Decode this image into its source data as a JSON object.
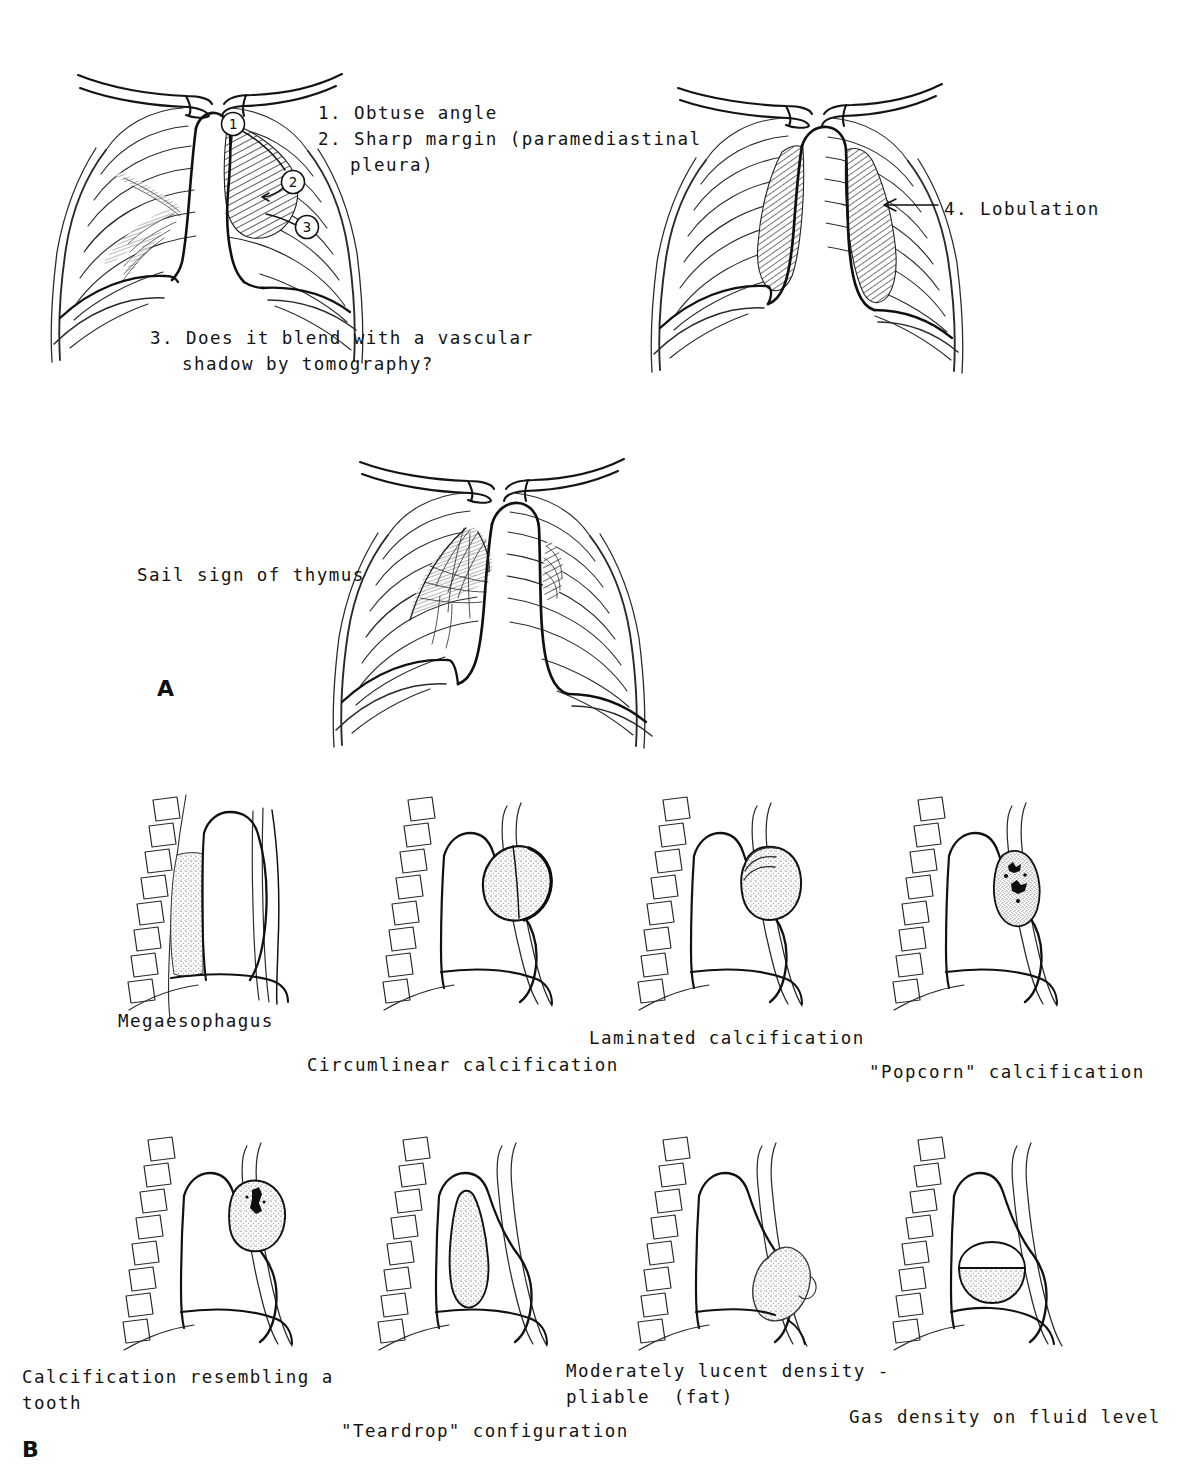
{
  "figure": {
    "panels": [
      {
        "id": "A",
        "letter": "A"
      },
      {
        "id": "B",
        "letter": "B"
      }
    ]
  },
  "panel_a": {
    "numbered_findings": [
      {
        "number": "1",
        "line1": "1. Obtuse angle",
        "marker": "1"
      },
      {
        "number": "2",
        "line1": "2. Sharp margin (paramediastinal",
        "line2": "pleura)",
        "marker": "2"
      },
      {
        "number": "3",
        "line1": "3. Does it blend with a vascular",
        "line2": "shadow by tomography?",
        "marker": "3"
      },
      {
        "number": "4",
        "line1": "4. Lobulation",
        "marker": "4"
      }
    ],
    "sail_sign_label": "Sail sign of thymus",
    "markers": [
      "1",
      "2",
      "3"
    ]
  },
  "panel_b": {
    "captions": [
      {
        "id": "megaesophagus",
        "line1": "Megaesophagus"
      },
      {
        "id": "circumlinear-calcification",
        "line1": "Circumlinear calcification"
      },
      {
        "id": "laminated-calcification",
        "line1": "Laminated calcification"
      },
      {
        "id": "popcorn-calcification",
        "line1": "\"Popcorn\" calcification"
      },
      {
        "id": "tooth-calcification",
        "line1": "Calcification resembling a",
        "line2": "tooth"
      },
      {
        "id": "teardrop-configuration",
        "line1": "\"Teardrop\" configuration"
      },
      {
        "id": "fat-density",
        "line1": "Moderately lucent density -",
        "line2": "pliable  (fat)"
      },
      {
        "id": "gas-fluid-level",
        "line1": "Gas density on fluid level"
      }
    ]
  },
  "colors": {
    "ink": "#131313",
    "line": "#1a1a1a",
    "light_line": "#555555",
    "stipple": "#7a7a7a",
    "background": "#ffffff"
  }
}
